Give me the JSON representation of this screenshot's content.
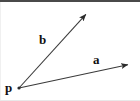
{
  "figure": {
    "type": "vector-diagram",
    "background_color": "#ffffff",
    "stroke_color": "#3a3a3a",
    "label_color": "#111111",
    "top_band_color": "#4a4a4a",
    "canvas": {
      "width": 140,
      "height": 101
    },
    "origin": {
      "name": "p",
      "x": 19,
      "y": 88
    },
    "vectors": [
      {
        "name": "b",
        "label": "b",
        "from": {
          "x": 19,
          "y": 88
        },
        "to": {
          "x": 88,
          "y": 12
        },
        "label_position": {
          "x": 39,
          "y": 33
        },
        "arrowhead": "filled-triangle"
      },
      {
        "name": "a",
        "label": "a",
        "from": {
          "x": 19,
          "y": 88
        },
        "to": {
          "x": 131,
          "y": 64
        },
        "label_position": {
          "x": 93,
          "y": 53
        },
        "arrowhead": "filled-triangle"
      }
    ],
    "point_label": "p",
    "labels": {
      "vector_a": "a",
      "vector_b": "b",
      "point_p": "p"
    }
  }
}
